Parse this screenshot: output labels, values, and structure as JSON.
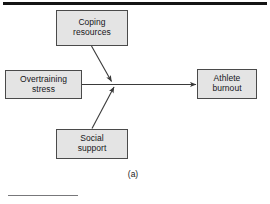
{
  "figure": {
    "caption": "(a)",
    "colors": {
      "node_fill": "#e4e4e4",
      "node_border": "#4a4a4a",
      "edge": "#3a3a3a",
      "rule_top": "#141414",
      "rule_bottom": "#77777a",
      "background": "#ffffff",
      "text": "#16161a"
    },
    "nodes": [
      {
        "id": "coping",
        "line1": "Coping",
        "line2": "resources"
      },
      {
        "id": "stress",
        "line1": "Overtraining",
        "line2": "stress"
      },
      {
        "id": "social",
        "line1": "Social",
        "line2": "support"
      },
      {
        "id": "burnout",
        "line1": "Athlete",
        "line2": "burnout"
      }
    ],
    "edges": [
      {
        "id": "stress-to-burnout",
        "from": "stress",
        "to": "burnout",
        "style": "solid",
        "arrow": "end"
      },
      {
        "id": "coping-moderates",
        "from": "coping",
        "to": "stress-to-burnout",
        "style": "solid",
        "arrow": "end"
      },
      {
        "id": "social-moderates",
        "from": "social",
        "to": "stress-to-burnout",
        "style": "solid",
        "arrow": "end"
      }
    ]
  }
}
